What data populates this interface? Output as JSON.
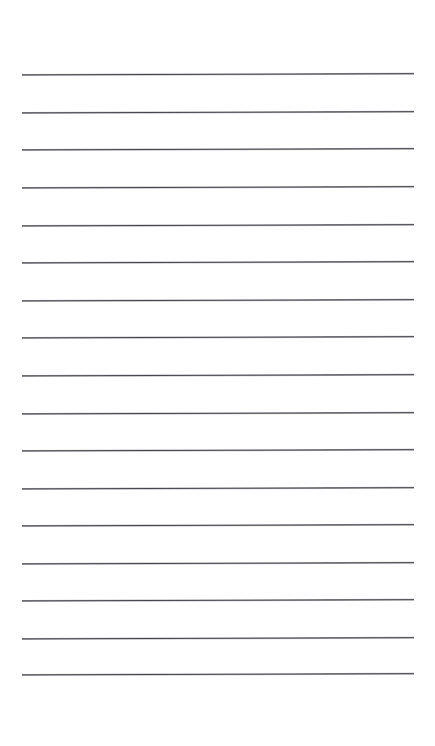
{
  "document": {
    "kind": "ruled-paper",
    "title": "Blank ruled note page",
    "page_number": "",
    "body_text": "",
    "background_color": "#ffffff",
    "rule_color": "#3a3a42",
    "canvas": {
      "width": 435,
      "height": 746
    }
  },
  "rules": {
    "count": 17,
    "line_start_x": 22,
    "line_end_x": 414,
    "line_length": 392,
    "first_line_y": 75,
    "spacing": 37.5,
    "thickness": 1.6,
    "slant_degrees": -0.18,
    "y_positions": [
      75,
      113,
      150,
      188,
      226,
      263,
      301,
      338,
      376,
      414,
      451,
      489,
      526,
      564,
      601,
      639,
      675
    ]
  },
  "margins": {
    "top": 75,
    "bottom": 71,
    "left": 22,
    "right": 21
  },
  "content": {
    "lines": [
      "",
      "",
      "",
      "",
      "",
      "",
      "",
      "",
      "",
      "",
      "",
      "",
      "",
      "",
      "",
      "",
      ""
    ]
  }
}
